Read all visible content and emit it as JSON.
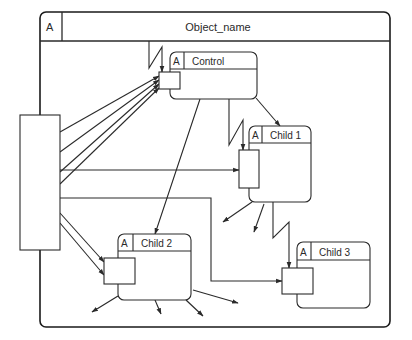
{
  "frame": {
    "title": "Object_name",
    "tag": "A",
    "x": 40,
    "y": 12,
    "w": 350,
    "h": 315,
    "header_h": 29,
    "tag_w": 22
  },
  "external_block": {
    "x": 20,
    "y": 115,
    "w": 40,
    "h": 135
  },
  "objects": [
    {
      "id": "control",
      "tag": "A",
      "name": "Control",
      "x": 170,
      "y": 52,
      "w": 87,
      "h": 47,
      "header_h": 17,
      "tag_w": 14,
      "port": {
        "x": 159,
        "y": 72,
        "w": 21,
        "h": 17
      }
    },
    {
      "id": "child1",
      "tag": "A",
      "name": "Child 1",
      "x": 249,
      "y": 126,
      "w": 62,
      "h": 76,
      "header_h": 17,
      "tag_w": 13,
      "port": {
        "x": 239,
        "y": 150,
        "w": 20,
        "h": 38
      }
    },
    {
      "id": "child2",
      "tag": "A",
      "name": "Child 2",
      "x": 118,
      "y": 234,
      "w": 73,
      "h": 66,
      "header_h": 17,
      "tag_w": 15,
      "port": {
        "x": 104,
        "y": 258,
        "w": 31,
        "h": 26
      }
    },
    {
      "id": "child3",
      "tag": "A",
      "name": "Child 3",
      "x": 297,
      "y": 242,
      "w": 73,
      "h": 66,
      "header_h": 18,
      "tag_w": 14,
      "port": {
        "x": 282,
        "y": 268,
        "w": 31,
        "h": 26
      }
    }
  ],
  "arrows": [
    {
      "from": "external",
      "to": "control-port",
      "points": [
        [
          60,
          132
        ],
        [
          159,
          76
        ]
      ]
    },
    {
      "from": "external",
      "to": "control-port",
      "points": [
        [
          60,
          152
        ],
        [
          159,
          80
        ]
      ]
    },
    {
      "from": "external",
      "to": "control-port",
      "points": [
        [
          60,
          172
        ],
        [
          159,
          84
        ]
      ]
    },
    {
      "from": "external",
      "to": "control-port",
      "points": [
        [
          60,
          184
        ],
        [
          159,
          88
        ]
      ]
    },
    {
      "from": "external",
      "to": "child1-port",
      "points": [
        [
          60,
          170
        ],
        [
          239,
          170
        ]
      ]
    },
    {
      "from": "external",
      "to": "child3-port",
      "points": [
        [
          60,
          198
        ],
        [
          211,
          198
        ],
        [
          211,
          281
        ],
        [
          282,
          281
        ]
      ]
    },
    {
      "from": "external",
      "to": "child2-port",
      "points": [
        [
          60,
          213
        ],
        [
          104,
          262
        ]
      ]
    },
    {
      "from": "external",
      "to": "child2-port",
      "points": [
        [
          60,
          223
        ],
        [
          104,
          275
        ]
      ]
    },
    {
      "from": "control",
      "to": "child2",
      "points": [
        [
          200,
          99
        ],
        [
          155,
          234
        ]
      ]
    },
    {
      "from": "control",
      "to": "child1",
      "points": [
        [
          256,
          98
        ],
        [
          280,
          126
        ]
      ]
    },
    {
      "from": "child1",
      "to": "out",
      "points": [
        [
          252,
          202
        ],
        [
          223,
          222
        ]
      ]
    },
    {
      "from": "child1",
      "to": "out",
      "points": [
        [
          264,
          204
        ],
        [
          254,
          232
        ]
      ]
    },
    {
      "from": "child2",
      "to": "out",
      "points": [
        [
          118,
          296
        ],
        [
          92,
          312
        ]
      ]
    },
    {
      "from": "child2",
      "to": "out",
      "points": [
        [
          155,
          300
        ],
        [
          161,
          314
        ]
      ]
    },
    {
      "from": "child2",
      "to": "out",
      "points": [
        [
          186,
          300
        ],
        [
          203,
          316
        ]
      ]
    },
    {
      "from": "child2",
      "to": "out",
      "points": [
        [
          193,
          290
        ],
        [
          238,
          303
        ]
      ]
    }
  ],
  "signal_arrows": [
    {
      "to": "control-port",
      "path": [
        [
          149,
          41
        ],
        [
          149,
          68
        ],
        [
          162,
          47
        ],
        [
          162,
          72
        ]
      ]
    },
    {
      "to": "child1-port",
      "path": [
        [
          229,
          99
        ],
        [
          229,
          145
        ],
        [
          243,
          120
        ],
        [
          243,
          150
        ]
      ]
    },
    {
      "to": "child3-port",
      "path": [
        [
          273,
          202
        ],
        [
          273,
          238
        ],
        [
          289,
          222
        ],
        [
          289,
          268
        ]
      ]
    }
  ],
  "colors": {
    "line": "#2a2a2a",
    "frame": "#1a1a1a",
    "background": "#ffffff"
  }
}
